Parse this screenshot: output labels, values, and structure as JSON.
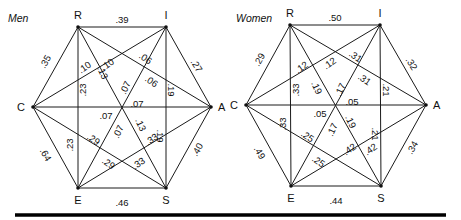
{
  "diagrams": [
    {
      "id": "men",
      "title": "Men",
      "title_pos": [
        8,
        22
      ],
      "vertices": {
        "R": {
          "x": 78,
          "y": 27,
          "lx": 78,
          "ly": 19,
          "anchor": "middle"
        },
        "I": {
          "x": 166,
          "y": 27,
          "lx": 166,
          "ly": 19,
          "anchor": "middle"
        },
        "A": {
          "x": 211,
          "y": 107,
          "lx": 218,
          "ly": 111,
          "anchor": "start"
        },
        "S": {
          "x": 166,
          "y": 188,
          "lx": 166,
          "ly": 204,
          "anchor": "middle"
        },
        "E": {
          "x": 78,
          "y": 188,
          "lx": 78,
          "ly": 204,
          "anchor": "middle"
        },
        "C": {
          "x": 33,
          "y": 107,
          "lx": 25,
          "ly": 111,
          "anchor": "end"
        }
      },
      "edges": [
        {
          "from": "R",
          "to": "I",
          "value": ".39",
          "labels": [
            [
              122,
              20,
              0
            ]
          ]
        },
        {
          "from": "I",
          "to": "A",
          "value": ".27",
          "labels": [
            [
              196,
              66,
              58
            ]
          ]
        },
        {
          "from": "A",
          "to": "S",
          "value": ".40",
          "labels": [
            [
              198,
              150,
              -60
            ]
          ]
        },
        {
          "from": "S",
          "to": "E",
          "value": ".46",
          "labels": [
            [
              122,
              203,
              0
            ]
          ]
        },
        {
          "from": "E",
          "to": "C",
          "value": ".64",
          "labels": [
            [
              45,
              155,
              60
            ]
          ]
        },
        {
          "from": "C",
          "to": "R",
          "value": ".35",
          "labels": [
            [
              46,
              62,
              -60
            ]
          ]
        },
        {
          "from": "R",
          "to": "E",
          "value": ".23",
          "labels": [
            [
              83,
              90,
              -90
            ],
            [
              70,
              145,
              -90
            ]
          ]
        },
        {
          "from": "I",
          "to": "S",
          "value": ".19",
          "labels": [
            [
              171,
              90,
              90
            ],
            [
              160,
              136,
              90
            ]
          ]
        },
        {
          "from": "R",
          "to": "S",
          "value": ".13",
          "labels": [
            [
              102,
              73,
              65
            ],
            [
              140,
              125,
              65
            ]
          ]
        },
        {
          "from": "I",
          "to": "E",
          "value": ".07",
          "labels": [
            [
              126,
              88,
              -65
            ],
            [
              119,
              132,
              -65
            ]
          ]
        },
        {
          "from": "C",
          "to": "A",
          "value": ".07",
          "labels": [
            [
              137,
              104,
              0
            ],
            [
              106,
              116,
              0
            ]
          ]
        },
        {
          "from": "R",
          "to": "A",
          "value": ".06",
          "labels": [
            [
              145,
              59,
              35
            ],
            [
              151,
              82,
              35
            ]
          ]
        },
        {
          "from": "I",
          "to": "C",
          "value": ".10",
          "labels": [
            [
              85,
              68,
              -35
            ],
            [
              108,
              65,
              -35
            ]
          ]
        },
        {
          "from": "C",
          "to": "S",
          "value": ".29",
          "labels": [
            [
              93,
              140,
              35
            ],
            [
              108,
              164,
              35
            ]
          ]
        },
        {
          "from": "A",
          "to": "E",
          "value": ".33",
          "labels": [
            [
              152,
              140,
              -35
            ],
            [
              139,
              164,
              -35
            ]
          ]
        }
      ]
    },
    {
      "id": "women",
      "title": "Women",
      "title_pos": [
        236,
        22
      ],
      "vertices": {
        "R": {
          "x": 290,
          "y": 25,
          "lx": 290,
          "ly": 17,
          "anchor": "middle"
        },
        "I": {
          "x": 380,
          "y": 25,
          "lx": 380,
          "ly": 17,
          "anchor": "middle"
        },
        "A": {
          "x": 426,
          "y": 105,
          "lx": 433,
          "ly": 109,
          "anchor": "start"
        },
        "S": {
          "x": 381,
          "y": 186,
          "lx": 381,
          "ly": 202,
          "anchor": "middle"
        },
        "E": {
          "x": 291,
          "y": 186,
          "lx": 291,
          "ly": 202,
          "anchor": "middle"
        },
        "C": {
          "x": 246,
          "y": 105,
          "lx": 238,
          "ly": 109,
          "anchor": "end"
        }
      },
      "edges": [
        {
          "from": "R",
          "to": "I",
          "value": ".50",
          "labels": [
            [
              335,
              18,
              0
            ]
          ]
        },
        {
          "from": "I",
          "to": "A",
          "value": ".32",
          "labels": [
            [
              411,
              64,
              58
            ]
          ]
        },
        {
          "from": "A",
          "to": "S",
          "value": ".34",
          "labels": [
            [
              413,
              148,
              -60
            ]
          ]
        },
        {
          "from": "S",
          "to": "E",
          "value": ".44",
          "labels": [
            [
              336,
              201,
              0
            ]
          ]
        },
        {
          "from": "E",
          "to": "C",
          "value": ".49",
          "labels": [
            [
              259,
              153,
              60
            ]
          ]
        },
        {
          "from": "C",
          "to": "R",
          "value": ".29",
          "labels": [
            [
              260,
              60,
              -60
            ]
          ]
        },
        {
          "from": "R",
          "to": "E",
          "value": ".33",
          "labels": [
            [
              296,
              90,
              -90
            ],
            [
              283,
              124,
              -90
            ]
          ]
        },
        {
          "from": "I",
          "to": "S",
          "value": ".21",
          "labels": [
            [
              386,
              90,
              90
            ],
            [
              375,
              134,
              90
            ]
          ]
        },
        {
          "from": "R",
          "to": "S",
          "value": ".19",
          "labels": [
            [
              316,
              88,
              65
            ],
            [
              350,
              122,
              65
            ]
          ]
        },
        {
          "from": "I",
          "to": "E",
          "value": ".17",
          "labels": [
            [
              341,
              90,
              -65
            ],
            [
              333,
              130,
              -65
            ]
          ]
        },
        {
          "from": "C",
          "to": "A",
          "value": ".05",
          "labels": [
            [
              352,
              102,
              0
            ],
            [
              320,
              114,
              0
            ]
          ]
        },
        {
          "from": "R",
          "to": "A",
          "value": ".31",
          "labels": [
            [
              355,
              57,
              35
            ],
            [
              364,
              80,
              35
            ]
          ]
        },
        {
          "from": "I",
          "to": "C",
          "value": ".12",
          "labels": [
            [
              302,
              68,
              -35
            ],
            [
              330,
              64,
              -35
            ]
          ]
        },
        {
          "from": "C",
          "to": "S",
          "value": ".25",
          "labels": [
            [
              307,
              137,
              35
            ],
            [
              318,
              162,
              35
            ]
          ]
        },
        {
          "from": "A",
          "to": "E",
          "value": ".42",
          "labels": [
            [
              350,
              150,
              -35
            ],
            [
              371,
              150,
              -35
            ]
          ]
        }
      ]
    }
  ],
  "rule": {
    "x1": 15,
    "x2": 446,
    "y": 215
  }
}
